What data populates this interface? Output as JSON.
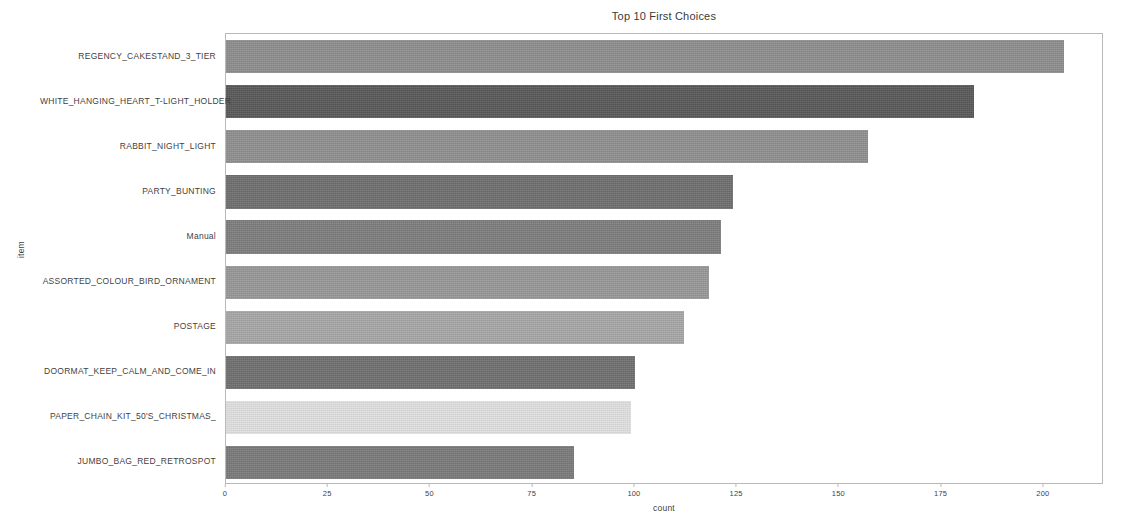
{
  "chart_data": {
    "type": "bar",
    "orientation": "horizontal",
    "title": "Top 10 First Choices",
    "xlabel": "count",
    "ylabel": "item",
    "categories": [
      "REGENCY_CAKESTAND_3_TIER",
      "WHITE_HANGING_HEART_T-LIGHT_HOLDER",
      "RABBIT_NIGHT_LIGHT",
      "PARTY_BUNTING",
      "Manual",
      "ASSORTED_COLOUR_BIRD_ORNAMENT",
      "POSTAGE",
      "DOORMAT_KEEP_CALM_AND_COME_IN",
      "PAPER_CHAIN_KIT_50'S_CHRISTMAS_",
      "JUMBO_BAG_RED_RETROSPOT"
    ],
    "values": [
      205,
      183,
      157,
      124,
      121,
      118,
      112,
      100,
      99,
      85
    ],
    "bar_colors": [
      "#8d8d8d",
      "#585858",
      "#8f8f8f",
      "#6e6e6e",
      "#7d7d7d",
      "#979797",
      "#a6a6a6",
      "#6f6f6f",
      "#e0e0e0",
      "#7a7a7a"
    ],
    "xlim": [
      0,
      214.7
    ],
    "xticks": [
      0,
      25,
      50,
      75,
      100,
      125,
      150,
      175,
      200
    ],
    "xticklabels": [
      "0",
      "25",
      "50",
      "75",
      "100",
      "125",
      "150",
      "175",
      "200"
    ],
    "grid": false,
    "legend": null
  }
}
